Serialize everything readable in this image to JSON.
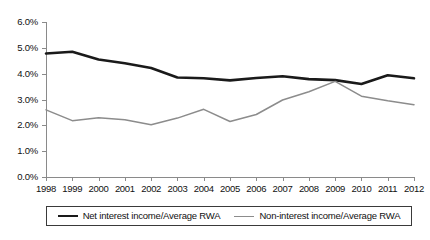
{
  "chart_data": {
    "type": "line",
    "title": "",
    "xlabel": "",
    "ylabel": "",
    "ylim": [
      0,
      6
    ],
    "ytick_labels": [
      "0.0%",
      "1.0%",
      "2.0%",
      "3.0%",
      "4.0%",
      "5.0%",
      "6.0%"
    ],
    "ytick_values": [
      0,
      1,
      2,
      3,
      4,
      5,
      6
    ],
    "grid": false,
    "legend_position": "bottom",
    "categories": [
      "1998",
      "1999",
      "2000",
      "2001",
      "2002",
      "2003",
      "2004",
      "2005",
      "2006",
      "2007",
      "2008",
      "2009",
      "2010",
      "2011",
      "2012"
    ],
    "series": [
      {
        "name": "Net interest income/Average RWA",
        "color": "#1a1a1a",
        "values": [
          4.78,
          4.85,
          4.55,
          4.4,
          4.22,
          3.85,
          3.82,
          3.74,
          3.83,
          3.9,
          3.79,
          3.75,
          3.6,
          3.94,
          3.82
        ]
      },
      {
        "name": "Non-interest income/Average RWA",
        "color": "#8c8c8c",
        "values": [
          2.6,
          2.18,
          2.29,
          2.22,
          2.02,
          2.28,
          2.62,
          2.15,
          2.42,
          2.98,
          3.3,
          3.7,
          3.13,
          2.95,
          2.8
        ]
      }
    ]
  },
  "legend": {
    "items": [
      {
        "label": "Net interest income/Average RWA"
      },
      {
        "label": "Non-interest income/Average RWA"
      }
    ]
  }
}
